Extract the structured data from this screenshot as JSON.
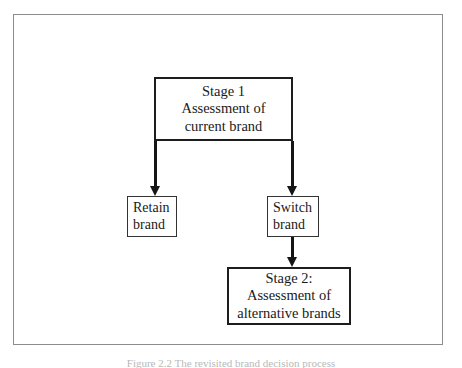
{
  "figure": {
    "caption": "Figure 2.2 The revisited brand decision process",
    "frame_color": "#8c8c8c",
    "ink_color": "#151515",
    "background": "#ffffff"
  },
  "diagram": {
    "type": "flowchart",
    "nodes": [
      {
        "id": "stage1",
        "lines": [
          "Stage 1",
          "Assessment of",
          "current brand"
        ],
        "style": "stage"
      },
      {
        "id": "retain",
        "lines": [
          "Retain",
          "brand"
        ],
        "style": "leaf"
      },
      {
        "id": "switch",
        "lines": [
          "Switch",
          "brand"
        ],
        "style": "leaf"
      },
      {
        "id": "stage2",
        "lines": [
          "Stage 2:",
          "Assessment of",
          "alternative brands"
        ],
        "style": "stage"
      }
    ],
    "edges": [
      {
        "id": "stage1-to-retain",
        "from": "stage1",
        "to": "retain",
        "arrow": "down"
      },
      {
        "id": "stage1-to-switch",
        "from": "stage1",
        "to": "switch",
        "arrow": "down"
      },
      {
        "id": "switch-to-stage2",
        "from": "switch",
        "to": "stage2",
        "arrow": "down"
      }
    ]
  }
}
